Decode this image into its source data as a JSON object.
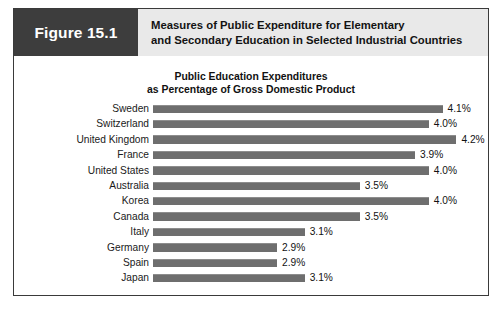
{
  "figure": {
    "number_label": "Figure 15.1",
    "title_line_1": "Measures of Public Expenditure for Elementary",
    "title_line_2": "and Secondary Education in Selected Industrial Countries"
  },
  "colors": {
    "figure_number_block": "#3d3d3d",
    "header_band": "#e9e9e9",
    "bar": "#6e6e6e",
    "frame_border": "#3a3a3a",
    "text": "#111111"
  },
  "chart_data": {
    "type": "bar",
    "orientation": "horizontal",
    "title": "Public Education Expenditures as Percentage of Gross Domestic Product",
    "title_line_1": "Public Education Expenditures",
    "title_line_2": "as Percentage of Gross Domestic Product",
    "xlabel": "",
    "ylabel": "",
    "grid": false,
    "legend": null,
    "axis_visible": false,
    "value_suffix": "%",
    "xlim": [
      2.0,
      4.4
    ],
    "categories": [
      "Sweden",
      "Switzerland",
      "United Kingdom",
      "France",
      "United States",
      "Australia",
      "Korea",
      "Canada",
      "Italy",
      "Germany",
      "Spain",
      "Japan"
    ],
    "values": [
      4.1,
      4.0,
      4.2,
      3.9,
      4.0,
      3.5,
      4.0,
      3.5,
      3.1,
      2.9,
      2.9,
      3.1
    ],
    "value_labels": [
      "4.1%",
      "4.0%",
      "4.2%",
      "3.9%",
      "4.0%",
      "3.5%",
      "4.0%",
      "3.5%",
      "3.1%",
      "2.9%",
      "2.9%",
      "3.1%"
    ],
    "rows": [
      {
        "country": "Sweden",
        "value": 4.1,
        "label": "4.1%"
      },
      {
        "country": "Switzerland",
        "value": 4.0,
        "label": "4.0%"
      },
      {
        "country": "United Kingdom",
        "value": 4.2,
        "label": "4.2%"
      },
      {
        "country": "France",
        "value": 3.9,
        "label": "3.9%"
      },
      {
        "country": "United States",
        "value": 4.0,
        "label": "4.0%"
      },
      {
        "country": "Australia",
        "value": 3.5,
        "label": "3.5%"
      },
      {
        "country": "Korea",
        "value": 4.0,
        "label": "4.0%"
      },
      {
        "country": "Canada",
        "value": 3.5,
        "label": "3.5%"
      },
      {
        "country": "Italy",
        "value": 3.1,
        "label": "3.1%"
      },
      {
        "country": "Germany",
        "value": 2.9,
        "label": "2.9%"
      },
      {
        "country": "Spain",
        "value": 2.9,
        "label": "2.9%"
      },
      {
        "country": "Japan",
        "value": 3.1,
        "label": "3.1%"
      }
    ]
  }
}
